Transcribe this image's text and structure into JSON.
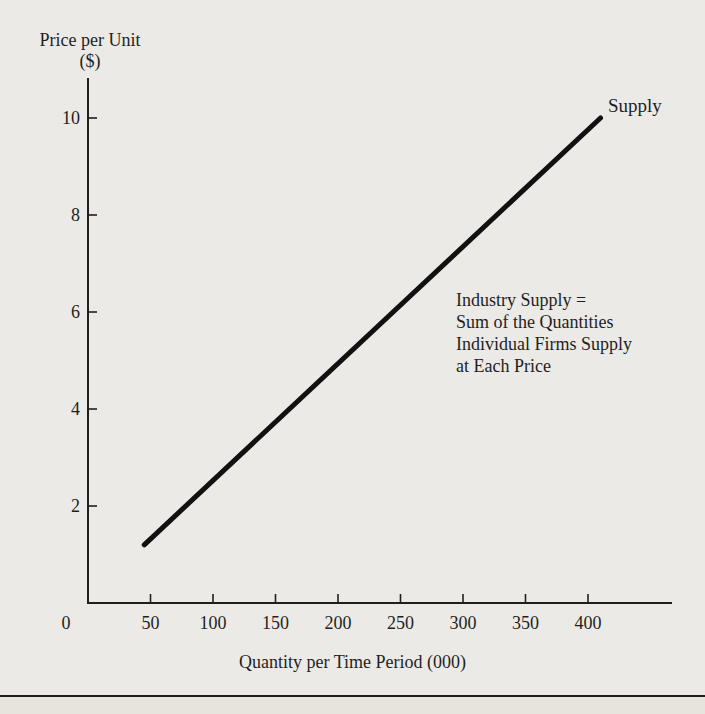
{
  "page": {
    "background": "#ebeae6",
    "ink": "#1f1f1f"
  },
  "chart_data": {
    "type": "line",
    "title": "",
    "ylabel": "Price per Unit ($)",
    "ylabel_lines": [
      "Price per Unit",
      "($)"
    ],
    "xlabel": "Quantity per Time Period (000)",
    "xlim": [
      0,
      460
    ],
    "ylim": [
      0,
      10.8
    ],
    "x_ticks": [
      50,
      100,
      150,
      200,
      250,
      300,
      350,
      400
    ],
    "y_ticks": [
      2,
      4,
      6,
      8,
      10
    ],
    "origin_label": "0",
    "grid": false,
    "legend_position": "end-of-line-label",
    "series": [
      {
        "name": "Supply",
        "points": [
          [
            45,
            1.2
          ],
          [
            410,
            10
          ]
        ],
        "color": "#111111",
        "width": 5
      }
    ],
    "annotation": "Industry Supply =\nSum of the Quantities\nIndividual Firms Supply\nat Each Price"
  }
}
